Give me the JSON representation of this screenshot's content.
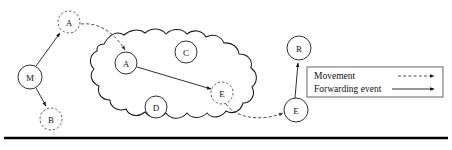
{
  "figure": {
    "canvas": {
      "width": 452,
      "height": 150
    },
    "background_color": "#ffffff",
    "stroke_color": "#1a1a1a",
    "dashed_stroke_color": "#3a3a3a"
  },
  "region": {
    "name": "cloud-region",
    "style": "irregular-wavy-closed-curve",
    "stroke": "#1a1a1a"
  },
  "nodes": [
    {
      "id": "a-outside",
      "label": "A",
      "cx": 69,
      "cy": 22,
      "r": 11,
      "style": "dashed",
      "inside_region": false
    },
    {
      "id": "m",
      "label": "M",
      "cx": 30,
      "cy": 77,
      "r": 12,
      "style": "solid",
      "inside_region": false
    },
    {
      "id": "b",
      "label": "B",
      "cx": 51,
      "cy": 119,
      "r": 11,
      "style": "dashed",
      "inside_region": false
    },
    {
      "id": "a-inside",
      "label": "A",
      "cx": 126,
      "cy": 63,
      "r": 11,
      "style": "solid",
      "inside_region": true
    },
    {
      "id": "c",
      "label": "C",
      "cx": 186,
      "cy": 52,
      "r": 11,
      "style": "solid",
      "inside_region": true
    },
    {
      "id": "d",
      "label": "D",
      "cx": 156,
      "cy": 107,
      "r": 11,
      "style": "solid",
      "inside_region": true
    },
    {
      "id": "e-inside",
      "label": "E",
      "cx": 222,
      "cy": 93,
      "r": 11,
      "style": "dashed",
      "inside_region": true
    },
    {
      "id": "e-outside",
      "label": "E",
      "cx": 296,
      "cy": 110,
      "r": 12,
      "style": "solid",
      "inside_region": false
    },
    {
      "id": "r",
      "label": "R",
      "cx": 299,
      "cy": 48,
      "r": 12,
      "style": "solid",
      "inside_region": false
    }
  ],
  "edges": [
    {
      "id": "m-to-a-outside",
      "from": "m",
      "to": "a-outside",
      "type": "movement",
      "style": "solid"
    },
    {
      "id": "m-to-b",
      "from": "m",
      "to": "b",
      "type": "movement",
      "style": "solid"
    },
    {
      "id": "a-outside-to-inside",
      "from": "a-outside",
      "to": "a-inside",
      "type": "movement",
      "style": "dashed"
    },
    {
      "id": "a-inside-to-e",
      "from": "a-inside",
      "to": "e-inside",
      "type": "forwarding-event",
      "style": "solid"
    },
    {
      "id": "e-inside-to-outside",
      "from": "e-inside",
      "to": "e-outside",
      "type": "movement",
      "style": "dashed"
    },
    {
      "id": "e-outside-to-r",
      "from": "e-outside",
      "to": "r",
      "type": "forwarding-event",
      "style": "solid"
    }
  ],
  "legend": {
    "box": {
      "x": 307,
      "y": 67,
      "width": 136,
      "height": 30
    },
    "entries": [
      {
        "id": "legend-movement",
        "label": "Movement",
        "line_style": "dashed"
      },
      {
        "id": "legend-forwarding",
        "label": "Forwarding event",
        "line_style": "solid"
      }
    ]
  },
  "bottom_rule": {
    "y": 138,
    "x1": 4,
    "x2": 448,
    "color": "#000000"
  }
}
